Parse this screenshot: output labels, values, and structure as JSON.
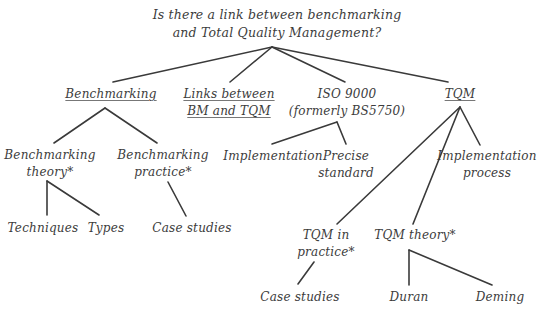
{
  "diagram": {
    "type": "tree",
    "root": {
      "lines": [
        "Is there a link between benchmarking",
        "and Total Quality Management?"
      ]
    },
    "nodes": {
      "benchmarking": {
        "lines": [
          "Benchmarking"
        ],
        "underlined": true
      },
      "links": {
        "lines": [
          "Links between",
          "BM and TQM"
        ],
        "underlined": true
      },
      "iso": {
        "lines": [
          "ISO 9000",
          "(formerly BS5750)"
        ],
        "underlined": false
      },
      "tqm": {
        "lines": [
          "TQM"
        ],
        "underlined": true
      },
      "bm_theory": {
        "lines": [
          "Benchmarking",
          "theory*"
        ]
      },
      "bm_practice": {
        "lines": [
          "Benchmarking",
          "practice*"
        ]
      },
      "implementation": {
        "lines": [
          "Implementation"
        ]
      },
      "precise_standard": {
        "lines": [
          "Precise",
          "standard"
        ]
      },
      "implementation_process": {
        "lines": [
          "Implementation",
          "process"
        ]
      },
      "techniques": {
        "lines": [
          "Techniques"
        ]
      },
      "types": {
        "lines": [
          "Types"
        ]
      },
      "bm_case_studies": {
        "lines": [
          "Case studies"
        ]
      },
      "tqm_practice": {
        "lines": [
          "TQM in",
          "practice*"
        ]
      },
      "tqm_theory": {
        "lines": [
          "TQM theory*"
        ]
      },
      "tqm_case_studies": {
        "lines": [
          "Case studies"
        ]
      },
      "duran": {
        "lines": [
          "Duran"
        ]
      },
      "deming": {
        "lines": [
          "Deming"
        ]
      }
    },
    "edges": [
      [
        "root",
        "benchmarking"
      ],
      [
        "root",
        "links"
      ],
      [
        "root",
        "iso"
      ],
      [
        "root",
        "tqm"
      ],
      [
        "benchmarking",
        "bm_theory"
      ],
      [
        "benchmarking",
        "bm_practice"
      ],
      [
        "bm_theory",
        "techniques"
      ],
      [
        "bm_theory",
        "types"
      ],
      [
        "bm_practice",
        "bm_case_studies"
      ],
      [
        "iso",
        "implementation"
      ],
      [
        "iso",
        "precise_standard"
      ],
      [
        "tqm",
        "tqm_practice"
      ],
      [
        "tqm",
        "tqm_theory"
      ],
      [
        "tqm",
        "implementation_process"
      ],
      [
        "tqm_practice",
        "tqm_case_studies"
      ],
      [
        "tqm_theory",
        "duran"
      ],
      [
        "tqm_theory",
        "deming"
      ]
    ]
  }
}
